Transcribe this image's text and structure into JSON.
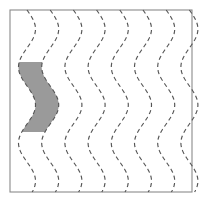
{
  "figure": {
    "type": "diagram",
    "title": "",
    "canvas": {
      "width": 201,
      "height": 203,
      "background": "#ffffff"
    },
    "frame": {
      "x": 10,
      "y": 10,
      "width": 182,
      "height": 182,
      "stroke": "#8a8a8a",
      "stroke_width": 1.1,
      "fill": "none"
    },
    "waves": {
      "count": 8,
      "first_x": 27,
      "spacing": 23.2,
      "amplitude": 8.5,
      "period": 76,
      "phase_deg": 0,
      "top_y": 10,
      "bottom_y": 192,
      "stroke": "#555555",
      "stroke_width": 1.15,
      "dash_pattern": "4.2 3.2",
      "x_positions": [
        27,
        50.2,
        73.4,
        96.6,
        119.8,
        143.0,
        166.2,
        189.4
      ]
    },
    "shaded_band": {
      "label": "shaded-region",
      "between_waves": [
        1,
        2
      ],
      "left_wave_index": 0,
      "right_wave_index": 1,
      "top_y": 62,
      "bottom_y": 132,
      "fill": "#9a9a9a",
      "opacity": 1,
      "stroke": "none"
    }
  }
}
